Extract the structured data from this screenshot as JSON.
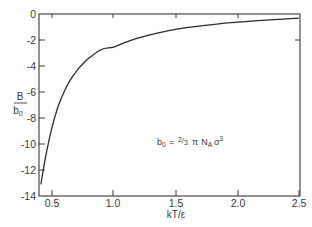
{
  "chart_data": {
    "type": "line",
    "title": "",
    "xlabel": "kT/ε",
    "ylabel_numerator": "B",
    "ylabel_denominator": "b₀",
    "ylabel": "B / b₀",
    "xlim": [
      0.395,
      2.5
    ],
    "ylim": [
      -14,
      0
    ],
    "x_ticks": [
      0.5,
      1.0,
      1.5,
      2.0,
      2.5
    ],
    "x_tick_labels": [
      "0.5",
      "1.0",
      "1.5",
      "2.0",
      "2.5"
    ],
    "y_ticks": [
      0,
      -2,
      -4,
      -6,
      -8,
      -10,
      -12,
      -14
    ],
    "y_tick_labels": [
      "0",
      "-2",
      "-4",
      "-6",
      "-8",
      "-10",
      "-12",
      "-14"
    ],
    "grid": false,
    "legend": null,
    "annotation": {
      "text_parts": [
        "b",
        "0",
        " = ",
        "2",
        "/",
        "3",
        " π N",
        "A",
        " σ",
        "3"
      ],
      "plain": "b₀ = ⅔ π Nₐ σ³"
    },
    "series": [
      {
        "name": "B/b0",
        "color": "#2a2a2a",
        "x": [
          0.41,
          0.45,
          0.5,
          0.55,
          0.6,
          0.65,
          0.7,
          0.75,
          0.8,
          0.9,
          1.0,
          1.1,
          1.2,
          1.3,
          1.4,
          1.5,
          1.6,
          1.8,
          2.0,
          2.2,
          2.5
        ],
        "y": [
          -13.1,
          -10.9,
          -8.72,
          -7.1,
          -5.94,
          -5.05,
          -4.37,
          -3.83,
          -3.39,
          -2.73,
          -2.54,
          -2.16,
          -1.84,
          -1.58,
          -1.37,
          -1.19,
          -1.03,
          -0.81,
          -0.63,
          -0.49,
          -0.31
        ]
      }
    ]
  },
  "labels": {
    "xlabel": "kT/ε",
    "ylabel_num": "B",
    "ylabel_den": "b",
    "ylabel_den_sub": "0",
    "annot_b": "b",
    "annot_b_sub": "0",
    "annot_eq": "=",
    "annot_frac_num": "2",
    "annot_frac_slash": "/",
    "annot_frac_den": "3",
    "annot_pi": "π",
    "annot_N": "N",
    "annot_N_sub": "A",
    "annot_sigma": "σ",
    "annot_sigma_sup": "3",
    "xt0": "0.5",
    "xt1": "1.0",
    "xt2": "1.5",
    "xt3": "2.0",
    "xt4": "2.5",
    "yt0": "0",
    "yt1": "-2",
    "yt2": "-4",
    "yt3": "-6",
    "yt4": "-8",
    "yt5": "-10",
    "yt6": "-12",
    "yt7": "-14"
  }
}
